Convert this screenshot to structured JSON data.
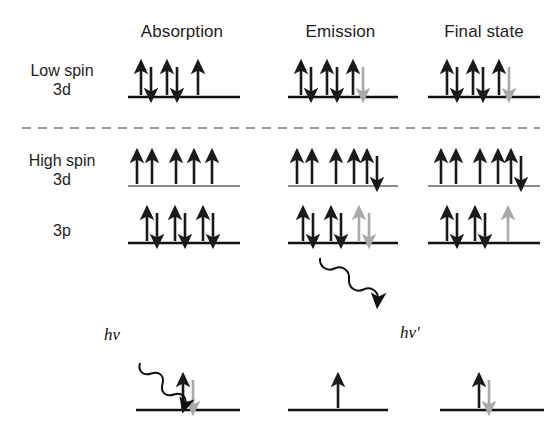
{
  "figure": {
    "title_row_headers": [
      "Absorption",
      "Emission",
      "Final state"
    ],
    "row_labels": [
      {
        "line1": "Low spin",
        "line2": "3d"
      },
      {
        "line1": "High spin",
        "line2": "3d"
      },
      {
        "line1": "3p",
        "line2": ""
      }
    ],
    "photon_labels": {
      "incoming": "hν",
      "outgoing": "hν′"
    },
    "colors": {
      "black_arrow": "#1a1a1a",
      "gray_arrow": "#a9a9a9",
      "level_line_dark": "#111111",
      "level_line_gray": "#8c8c8c",
      "divider": "#9a9a9a",
      "background": "#ffffff"
    },
    "divider": {
      "style": "dashed",
      "y": 128,
      "x_start": 22,
      "x_end": 540
    }
  },
  "columns": [
    {
      "name": "Absorption",
      "header_x": 182,
      "center_x": 182
    },
    {
      "name": "Emission",
      "header_x": 340,
      "center_x": 340
    },
    {
      "name": "Final state",
      "header_x": 482,
      "center_x": 482
    }
  ],
  "levels": [
    {
      "id": "low-spin-3d",
      "label": "Low spin 3d",
      "baseline_y": 97,
      "line_color": "#111111",
      "cells": [
        {
          "column": "Absorption",
          "line_x": 128,
          "line_w": 112,
          "sites": [
            {
              "x": 146,
              "up": "black",
              "down": "black"
            },
            {
              "x": 172,
              "up": "black",
              "down": "black"
            },
            {
              "x": 198,
              "up": "black",
              "down": null
            }
          ]
        },
        {
          "column": "Emission",
          "line_x": 288,
          "line_w": 110,
          "sites": [
            {
              "x": 306,
              "up": "black",
              "down": "black"
            },
            {
              "x": 332,
              "up": "black",
              "down": "black"
            },
            {
              "x": 358,
              "up": "black",
              "down": "gray"
            }
          ]
        },
        {
          "column": "Final state",
          "line_x": 428,
          "line_w": 112,
          "sites": [
            {
              "x": 452,
              "up": "black",
              "down": "black"
            },
            {
              "x": 478,
              "up": "black",
              "down": "black"
            },
            {
              "x": 504,
              "up": "black",
              "down": "gray"
            }
          ]
        }
      ]
    },
    {
      "id": "high-spin-3d",
      "label": "High spin 3d",
      "baseline_y": 186,
      "line_color": "#8c8c8c",
      "cells": [
        {
          "column": "Absorption",
          "line_x": 128,
          "line_w": 112,
          "sites": [
            {
              "x": 137,
              "up": "black",
              "down": null
            },
            {
              "x": 152,
              "up": "black",
              "down": null
            },
            {
              "x": 176,
              "up": "black",
              "down": null
            },
            {
              "x": 194,
              "up": "black",
              "down": null
            },
            {
              "x": 212,
              "up": "black",
              "down": null
            }
          ]
        },
        {
          "column": "Emission",
          "line_x": 288,
          "line_w": 110,
          "sites": [
            {
              "x": 297,
              "up": "black",
              "down": null
            },
            {
              "x": 312,
              "up": "black",
              "down": null
            },
            {
              "x": 336,
              "up": "black",
              "down": null
            },
            {
              "x": 354,
              "up": "black",
              "down": null
            },
            {
              "x": 372,
              "up": "black",
              "down": "black"
            }
          ]
        },
        {
          "column": "Final state",
          "line_x": 428,
          "line_w": 112,
          "sites": [
            {
              "x": 441,
              "up": "black",
              "down": null
            },
            {
              "x": 456,
              "up": "black",
              "down": null
            },
            {
              "x": 480,
              "up": "black",
              "down": null
            },
            {
              "x": 498,
              "up": "black",
              "down": null
            },
            {
              "x": 516,
              "up": "black",
              "down": "black"
            }
          ]
        }
      ]
    },
    {
      "id": "3p",
      "label": "3p",
      "baseline_y": 243,
      "line_color": "#111111",
      "cells": [
        {
          "column": "Absorption",
          "line_x": 128,
          "line_w": 112,
          "sites": [
            {
              "x": 152,
              "up": "black",
              "down": "black"
            },
            {
              "x": 180,
              "up": "black",
              "down": "black"
            },
            {
              "x": 208,
              "up": "black",
              "down": "black"
            }
          ]
        },
        {
          "column": "Emission",
          "line_x": 288,
          "line_w": 110,
          "sites": [
            {
              "x": 308,
              "up": "black",
              "down": "black"
            },
            {
              "x": 336,
              "up": "black",
              "down": "black"
            },
            {
              "x": 364,
              "up": "gray",
              "down": "gray"
            }
          ]
        },
        {
          "column": "Final state",
          "line_x": 428,
          "line_w": 112,
          "sites": [
            {
              "x": 452,
              "up": "black",
              "down": "black"
            },
            {
              "x": 480,
              "up": "black",
              "down": "black"
            },
            {
              "x": 508,
              "up": "gray",
              "down": null
            }
          ]
        }
      ]
    },
    {
      "id": "bottom-level",
      "label": "",
      "baseline_y": 410,
      "line_color": "#111111",
      "cells": [
        {
          "column": "Absorption",
          "line_x": 136,
          "line_w": 104,
          "sites": [
            {
              "x": 188,
              "up": "black",
              "down": "gray"
            }
          ]
        },
        {
          "column": "Emission",
          "line_x": 288,
          "line_w": 100,
          "sites": [
            {
              "x": 338,
              "up": "black",
              "down": null
            }
          ]
        },
        {
          "column": "Final state",
          "line_x": 440,
          "line_w": 104,
          "sites": [
            {
              "x": 484,
              "up": "black",
              "down": "gray"
            }
          ]
        }
      ]
    }
  ],
  "photons": [
    {
      "name": "incoming-photon",
      "label": "hν",
      "label_x": 108,
      "label_y": 335,
      "wave_start": [
        140,
        363
      ],
      "wave_end": [
        185,
        405
      ]
    },
    {
      "name": "outgoing-photon",
      "label": "hν′",
      "label_x": 404,
      "label_y": 333,
      "wave_start": [
        320,
        258
      ],
      "wave_end": [
        378,
        300
      ]
    }
  ]
}
